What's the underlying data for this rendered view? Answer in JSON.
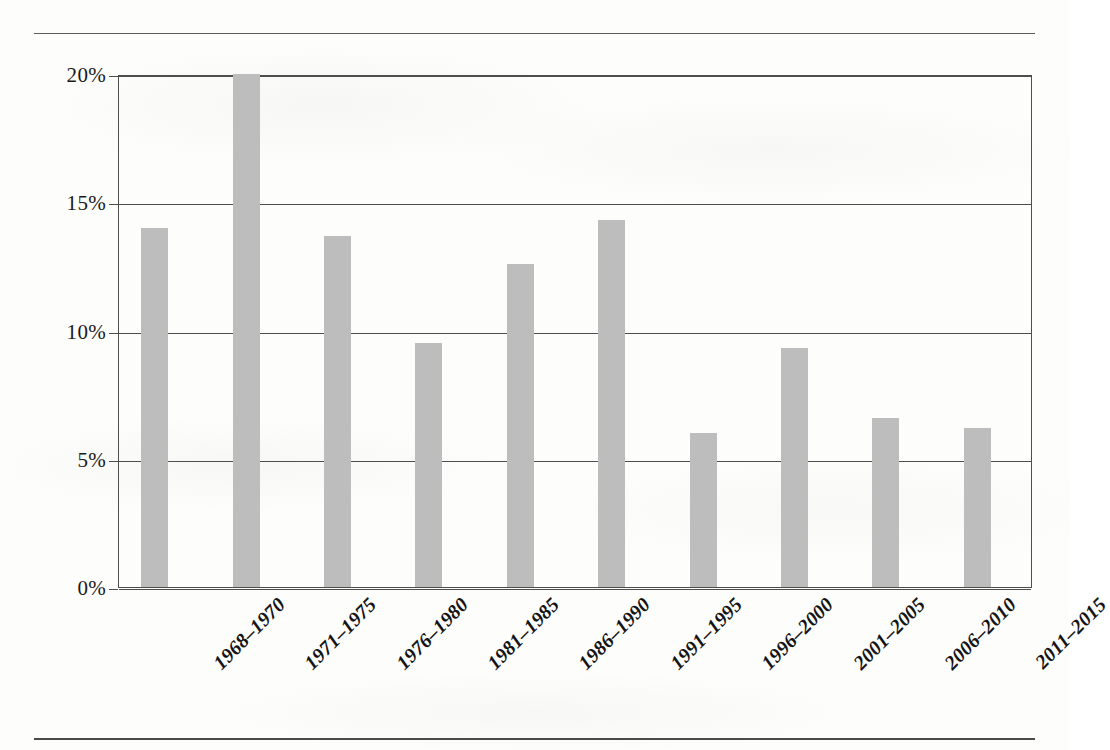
{
  "chart_data": {
    "type": "bar",
    "title": "",
    "xlabel": "",
    "ylabel": "",
    "ylim": [
      0,
      20
    ],
    "grid": true,
    "legend": "none",
    "y_tick_labels": [
      "0%",
      "5%",
      "10%",
      "15%",
      "20%"
    ],
    "y_tick_values": [
      0,
      5,
      10,
      15,
      20
    ],
    "categories": [
      "1968–1970",
      "1971–1975",
      "1976–1980",
      "1981–1985",
      "1986–1990",
      "1991–1995",
      "1996–2000",
      "2001–2005",
      "2006–2010",
      "2011–2015"
    ],
    "values": [
      14.0,
      20.0,
      13.7,
      9.5,
      12.6,
      14.3,
      6.0,
      9.3,
      6.6,
      6.2
    ],
    "bar_color": "#bdbdbd",
    "axis_color": "#4e4e4e"
  },
  "page": {
    "background_color": "#fdfdfc",
    "rule_color": "#5d5d5d"
  }
}
